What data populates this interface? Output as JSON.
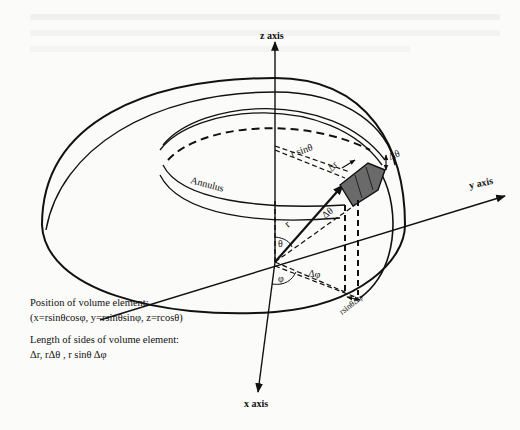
{
  "figure": {
    "axes": {
      "z": "z axis",
      "y": "y axis",
      "x": "x axis"
    },
    "labels": {
      "annulus": "Annulus",
      "r": "r",
      "r_sin_theta": "r sinθ",
      "delta_r": "Δr",
      "delta_theta_top": "Δθ",
      "delta_theta_arc": "Δθ",
      "theta": "θ",
      "phi": "φ",
      "delta_phi": "Δφ",
      "r_sin_theta_delta_phi": "rsinθΔφ"
    },
    "captions": {
      "position_title": "Position of volume element:",
      "position_formula": "(x=rsinθcosφ, y=rsinθsinφ, z=rcosθ)",
      "length_title": "Length of sides of volume element:",
      "length_formula": "Δr, rΔθ , r sinθ Δφ"
    }
  }
}
